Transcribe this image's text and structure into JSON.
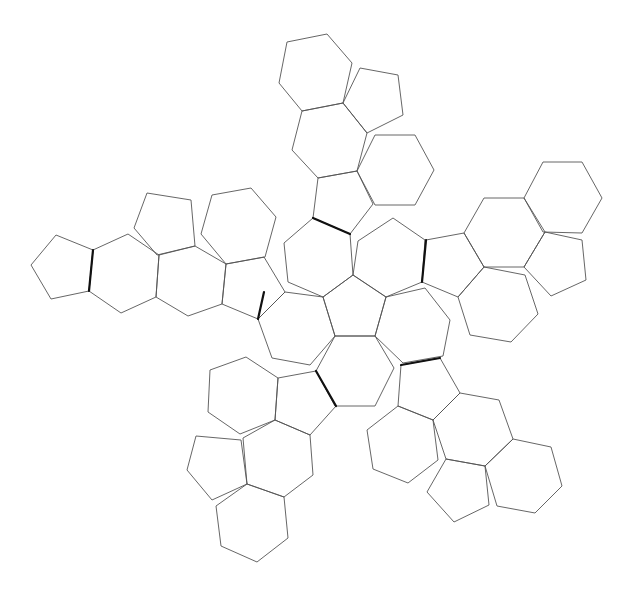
{
  "diagram": {
    "title": "",
    "colors": {
      "background": "#ffffff",
      "face_stroke": "#555555",
      "hinge_stroke": "#111111"
    },
    "counts": {
      "pentagons": 12,
      "hexagons": 20
    },
    "faces": [
      {
        "id": "center-pentagon",
        "type": "pentagon",
        "points": [
          [
            353,
            275
          ],
          [
            386,
            297
          ],
          [
            375,
            336
          ],
          [
            335,
            336
          ],
          [
            323,
            297
          ]
        ]
      },
      {
        "id": "hex-top-left",
        "type": "hexagon",
        "points": [
          [
            313,
            218
          ],
          [
            350,
            234
          ],
          [
            353,
            275
          ],
          [
            323,
            297
          ],
          [
            288,
            282
          ],
          [
            284,
            243
          ]
        ]
      },
      {
        "id": "hex-top-right",
        "type": "hexagon",
        "points": [
          [
            393,
            218
          ],
          [
            425,
            240
          ],
          [
            422,
            282
          ],
          [
            386,
            297
          ],
          [
            353,
            275
          ],
          [
            358,
            241
          ]
        ]
      },
      {
        "id": "hex-right",
        "type": "hexagon",
        "points": [
          [
            386,
            297
          ],
          [
            425,
            288
          ],
          [
            450,
            320
          ],
          [
            443,
            356
          ],
          [
            403,
            363
          ],
          [
            375,
            336
          ]
        ]
      },
      {
        "id": "hex-bottom",
        "type": "hexagon",
        "points": [
          [
            335,
            336
          ],
          [
            375,
            336
          ],
          [
            394,
            368
          ],
          [
            375,
            406
          ],
          [
            335,
            406
          ],
          [
            316,
            371
          ]
        ]
      },
      {
        "id": "hex-left",
        "type": "hexagon",
        "points": [
          [
            285,
            292
          ],
          [
            323,
            297
          ],
          [
            335,
            336
          ],
          [
            310,
            365
          ],
          [
            272,
            358
          ],
          [
            258,
            319
          ]
        ]
      },
      {
        "id": "top-pent-1",
        "type": "pentagon",
        "points": [
          [
            318,
            178
          ],
          [
            357,
            171
          ],
          [
            373,
            204
          ],
          [
            350,
            234
          ],
          [
            313,
            218
          ]
        ]
      },
      {
        "id": "top-hex-1",
        "type": "hexagon",
        "points": [
          [
            302,
            111
          ],
          [
            343,
            103
          ],
          [
            367,
            133
          ],
          [
            357,
            171
          ],
          [
            318,
            178
          ],
          [
            292,
            150
          ]
        ]
      },
      {
        "id": "top-hex-side",
        "type": "hexagon",
        "points": [
          [
            375,
            135
          ],
          [
            415,
            135
          ],
          [
            434,
            170
          ],
          [
            415,
            205
          ],
          [
            375,
            205
          ],
          [
            357,
            171
          ]
        ]
      },
      {
        "id": "top-hex-2",
        "type": "hexagon",
        "points": [
          [
            287,
            42
          ],
          [
            327,
            34
          ],
          [
            352,
            63
          ],
          [
            343,
            103
          ],
          [
            302,
            111
          ],
          [
            279,
            83
          ]
        ]
      },
      {
        "id": "top-pent-side",
        "type": "pentagon",
        "points": [
          [
            360,
            68
          ],
          [
            398,
            75
          ],
          [
            403,
            115
          ],
          [
            367,
            133
          ],
          [
            343,
            103
          ]
        ]
      },
      {
        "id": "right-pent-1",
        "type": "pentagon",
        "points": [
          [
            426,
            240
          ],
          [
            464,
            233
          ],
          [
            484,
            267
          ],
          [
            458,
            297
          ],
          [
            422,
            282
          ]
        ]
      },
      {
        "id": "right-hex-1",
        "type": "hexagon",
        "points": [
          [
            484,
            198
          ],
          [
            524,
            198
          ],
          [
            545,
            232
          ],
          [
            524,
            267
          ],
          [
            484,
            267
          ],
          [
            464,
            233
          ]
        ]
      },
      {
        "id": "right-hex-low",
        "type": "hexagon",
        "points": [
          [
            484,
            267
          ],
          [
            525,
            275
          ],
          [
            538,
            314
          ],
          [
            511,
            342
          ],
          [
            470,
            335
          ],
          [
            458,
            297
          ]
        ]
      },
      {
        "id": "right-hex-2",
        "type": "hexagon",
        "points": [
          [
            543,
            162
          ],
          [
            582,
            162
          ],
          [
            602,
            198
          ],
          [
            582,
            233
          ],
          [
            543,
            232
          ],
          [
            524,
            198
          ]
        ]
      },
      {
        "id": "right-pent-side",
        "type": "pentagon",
        "points": [
          [
            545,
            232
          ],
          [
            582,
            240
          ],
          [
            586,
            280
          ],
          [
            551,
            296
          ],
          [
            524,
            267
          ]
        ]
      },
      {
        "id": "left-pent-1",
        "type": "pentagon",
        "points": [
          [
            226,
            264
          ],
          [
            264,
            257
          ],
          [
            285,
            292
          ],
          [
            258,
            319
          ],
          [
            222,
            304
          ]
        ]
      },
      {
        "id": "left-hex-1",
        "type": "hexagon",
        "points": [
          [
            159,
            255
          ],
          [
            195,
            246
          ],
          [
            226,
            264
          ],
          [
            222,
            304
          ],
          [
            188,
            316
          ],
          [
            156,
            297
          ]
        ]
      },
      {
        "id": "left-hex-up",
        "type": "hexagon",
        "points": [
          [
            212,
            195
          ],
          [
            251,
            188
          ],
          [
            276,
            217
          ],
          [
            265,
            257
          ],
          [
            226,
            264
          ],
          [
            201,
            234
          ]
        ]
      },
      {
        "id": "left-hex-2",
        "type": "hexagon",
        "points": [
          [
            93,
            250
          ],
          [
            128,
            234
          ],
          [
            159,
            255
          ],
          [
            156,
            297
          ],
          [
            121,
            313
          ],
          [
            89,
            291
          ]
        ]
      },
      {
        "id": "left-pent-up",
        "type": "pentagon",
        "points": [
          [
            147,
            193
          ],
          [
            191,
            200
          ],
          [
            195,
            246
          ],
          [
            157,
            255
          ],
          [
            134,
            228
          ]
        ]
      },
      {
        "id": "left-pent-end",
        "type": "pentagon",
        "points": [
          [
            56,
            235
          ],
          [
            93,
            250
          ],
          [
            89,
            291
          ],
          [
            51,
            299
          ],
          [
            31,
            265
          ]
        ]
      },
      {
        "id": "bottom-left-pent-1",
        "type": "pentagon",
        "points": [
          [
            278,
            378
          ],
          [
            316,
            371
          ],
          [
            336,
            406
          ],
          [
            310,
            435
          ],
          [
            275,
            420
          ]
        ]
      },
      {
        "id": "bottom-left-hex-up",
        "type": "hexagon",
        "points": [
          [
            210,
            370
          ],
          [
            246,
            357
          ],
          [
            278,
            378
          ],
          [
            275,
            420
          ],
          [
            240,
            434
          ],
          [
            208,
            412
          ]
        ]
      },
      {
        "id": "bottom-left-hex-1",
        "type": "hexagon",
        "points": [
          [
            243,
            438
          ],
          [
            275,
            420
          ],
          [
            310,
            435
          ],
          [
            313,
            475
          ],
          [
            284,
            497
          ],
          [
            247,
            484
          ]
        ]
      },
      {
        "id": "bottom-left-pent-side",
        "type": "pentagon",
        "points": [
          [
            196,
            436
          ],
          [
            241,
            440
          ],
          [
            247,
            484
          ],
          [
            212,
            500
          ],
          [
            187,
            470
          ]
        ]
      },
      {
        "id": "bottom-left-hex-2",
        "type": "hexagon",
        "points": [
          [
            216,
            506
          ],
          [
            247,
            484
          ],
          [
            284,
            497
          ],
          [
            288,
            538
          ],
          [
            257,
            562
          ],
          [
            221,
            546
          ]
        ]
      },
      {
        "id": "bottom-right-pent-1",
        "type": "pentagon",
        "points": [
          [
            401,
            365
          ],
          [
            440,
            358
          ],
          [
            460,
            393
          ],
          [
            433,
            420
          ],
          [
            398,
            406
          ]
        ]
      },
      {
        "id": "bottom-right-hex-down",
        "type": "hexagon",
        "points": [
          [
            398,
            406
          ],
          [
            433,
            420
          ],
          [
            438,
            460
          ],
          [
            408,
            483
          ],
          [
            373,
            469
          ],
          [
            367,
            430
          ]
        ]
      },
      {
        "id": "bottom-right-hex-1",
        "type": "hexagon",
        "points": [
          [
            460,
            393
          ],
          [
            499,
            400
          ],
          [
            513,
            439
          ],
          [
            485,
            466
          ],
          [
            446,
            459
          ],
          [
            433,
            420
          ]
        ]
      },
      {
        "id": "bottom-right-pent-side",
        "type": "pentagon",
        "points": [
          [
            446,
            459
          ],
          [
            485,
            466
          ],
          [
            489,
            505
          ],
          [
            454,
            522
          ],
          [
            427,
            492
          ]
        ]
      },
      {
        "id": "bottom-right-hex-2",
        "type": "hexagon",
        "points": [
          [
            513,
            439
          ],
          [
            551,
            447
          ],
          [
            562,
            486
          ],
          [
            535,
            513
          ],
          [
            497,
            506
          ],
          [
            485,
            466
          ]
        ]
      }
    ],
    "hinges": [
      {
        "id": "hinge-top",
        "from": [
          313,
          218
        ],
        "to": [
          350,
          234
        ]
      },
      {
        "id": "hinge-right",
        "from": [
          426,
          240
        ],
        "to": [
          422,
          282
        ]
      },
      {
        "id": "hinge-left-center",
        "from": [
          264,
          292
        ],
        "to": [
          258,
          319
        ]
      },
      {
        "id": "hinge-left-arm",
        "from": [
          93,
          250
        ],
        "to": [
          89,
          291
        ]
      },
      {
        "id": "hinge-bottom-left",
        "from": [
          316,
          371
        ],
        "to": [
          336,
          406
        ]
      },
      {
        "id": "hinge-bottom-right",
        "from": [
          401,
          365
        ],
        "to": [
          440,
          358
        ]
      }
    ]
  }
}
